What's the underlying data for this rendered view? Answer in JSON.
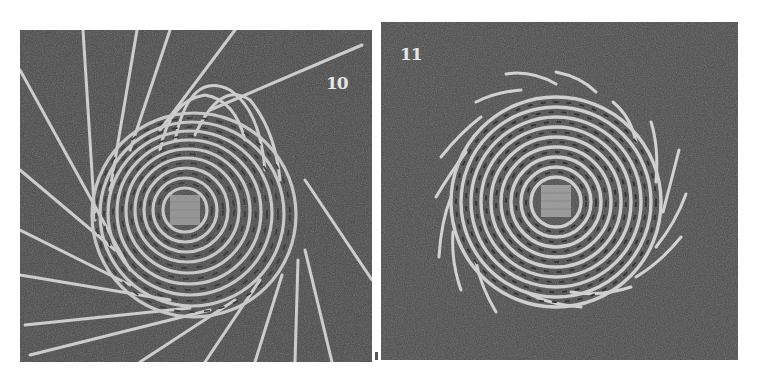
{
  "figure": {
    "background_color": "#ffffff",
    "panel_color": "#4a4a4a",
    "strand_color": "#cfcfcf",
    "panels": [
      {
        "label": "10",
        "content": "Coiled spiral base with long radiating stakes extending outward and looped strands at top"
      },
      {
        "label": "11",
        "content": "Finished coiled spiral base with short trimmed stake ends around the edge"
      }
    ]
  }
}
